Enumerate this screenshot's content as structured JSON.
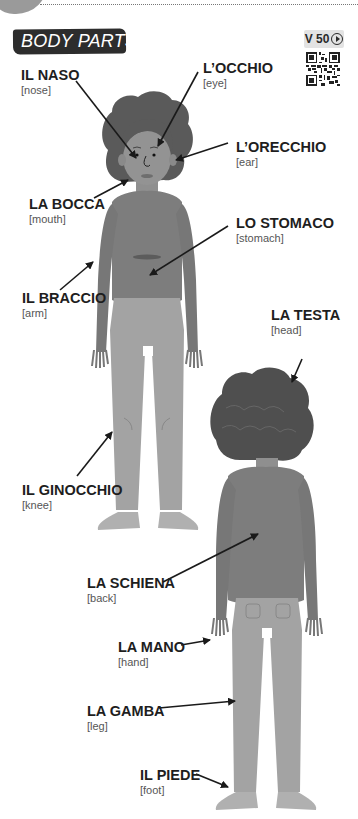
{
  "header": {
    "title": "BODY PARTS",
    "video_code": "V 50",
    "video_icon": "play-circle-icon",
    "qr_icon": "qr-code-icon"
  },
  "colors": {
    "title_badge": "#2d2d2d",
    "hair": "#5a5a5a",
    "skin": "#8f8f8f",
    "shirt": "#7d7d7d",
    "pants": "#a3a3a3",
    "shoes": "#b0b0b0",
    "text": "#1e1e1e"
  },
  "labels": [
    {
      "id": "nose",
      "italian": "IL NASO",
      "english": "[nose]"
    },
    {
      "id": "eye",
      "italian": "L’OCCHIO",
      "english": "[eye]"
    },
    {
      "id": "ear",
      "italian": "L’ORECCHIO",
      "english": "[ear]"
    },
    {
      "id": "mouth",
      "italian": "LA BOCCA",
      "english": "[mouth]"
    },
    {
      "id": "stomach",
      "italian": "LO STOMACO",
      "english": "[stomach]"
    },
    {
      "id": "arm",
      "italian": "IL BRACCIO",
      "english": "[arm]"
    },
    {
      "id": "head",
      "italian": "LA TESTA",
      "english": "[head]"
    },
    {
      "id": "knee",
      "italian": "IL GINOCCHIO",
      "english": "[knee]"
    },
    {
      "id": "back",
      "italian": "LA SCHIENA",
      "english": "[back]"
    },
    {
      "id": "hand",
      "italian": "LA MANO",
      "english": "[hand]"
    },
    {
      "id": "leg",
      "italian": "LA GAMBA",
      "english": "[leg]"
    },
    {
      "id": "foot",
      "italian": "IL PIEDE",
      "english": "[foot]"
    }
  ]
}
